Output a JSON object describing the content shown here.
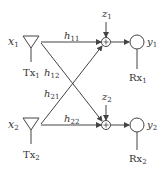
{
  "diagram": {
    "transmitters": [
      {
        "input": "x",
        "input_sub": "1",
        "label": "Tx",
        "label_sub": "1"
      },
      {
        "input": "x",
        "input_sub": "2",
        "label": "Tx",
        "label_sub": "2"
      }
    ],
    "receivers": [
      {
        "output": "y",
        "output_sub": "1",
        "label": "Rx",
        "label_sub": "1"
      },
      {
        "output": "y",
        "output_sub": "2",
        "label": "Rx",
        "label_sub": "2"
      }
    ],
    "noise": [
      {
        "name": "z",
        "sub": "1"
      },
      {
        "name": "z",
        "sub": "2"
      }
    ],
    "channels": [
      {
        "name": "h",
        "sub": "11",
        "from": "Tx1",
        "to": "Rx1"
      },
      {
        "name": "h",
        "sub": "12",
        "from": "Tx1",
        "to": "Rx2"
      },
      {
        "name": "h",
        "sub": "21",
        "from": "Tx2",
        "to": "Rx1"
      },
      {
        "name": "h",
        "sub": "22",
        "from": "Tx2",
        "to": "Rx2"
      }
    ],
    "adder_symbol": "+",
    "colors": {
      "stroke": "#444444",
      "text": "#333333",
      "background": "#ffffff"
    }
  }
}
